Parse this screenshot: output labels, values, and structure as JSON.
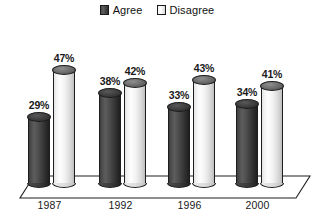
{
  "chart_data": {
    "type": "bar",
    "title": "",
    "subtitle": "",
    "xlabel": "",
    "ylabel": "",
    "categories": [
      "1987",
      "1992",
      "1996",
      "2000"
    ],
    "series": [
      {
        "name": "Agree",
        "color": "#3f3f3f",
        "values": [
          29,
          38,
          33,
          34
        ],
        "labels": [
          "29%",
          "38%",
          "33%",
          "34%"
        ]
      },
      {
        "name": "Disagree",
        "color": "#f2f2f2",
        "values": [
          47,
          42,
          43,
          41
        ],
        "labels": [
          "47%",
          "42%",
          "43%",
          "41%"
        ]
      }
    ],
    "ylim": [
      0,
      55
    ],
    "grid": false,
    "legend_position": "top-center",
    "value_labels": true,
    "style": "3d-cylinder"
  },
  "legend": {
    "items": [
      {
        "label": "Agree",
        "swatch": "dark"
      },
      {
        "label": "Disagree",
        "swatch": "light"
      }
    ]
  },
  "axis": {
    "categories": [
      "1987",
      "1992",
      "1996",
      "2000"
    ]
  }
}
